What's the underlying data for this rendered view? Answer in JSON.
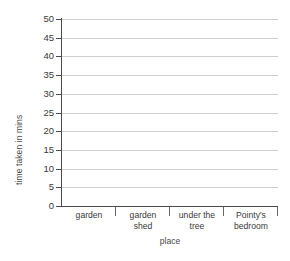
{
  "chart_data": {
    "type": "bar",
    "title": "",
    "subtitle": "",
    "xlabel": "place",
    "ylabel": "time taken in mins",
    "categories": [
      "garden",
      "garden shed",
      "under the tree",
      "Pointy's bedroom"
    ],
    "category_lines": [
      [
        "garden"
      ],
      [
        "garden",
        "shed"
      ],
      [
        "under the",
        "tree"
      ],
      [
        "Pointy's",
        "bedroom"
      ]
    ],
    "series": [
      {
        "name": "time taken",
        "values": [
          null,
          null,
          null,
          null
        ]
      }
    ],
    "values": [
      null,
      null,
      null,
      null
    ],
    "ylim": [
      0,
      50
    ],
    "ytick_step": 5,
    "yticks": [
      0,
      5,
      10,
      15,
      20,
      25,
      30,
      35,
      40,
      45,
      50
    ],
    "ytick_labels": [
      "0",
      "5",
      "10",
      "15",
      "20",
      "25",
      "30",
      "35",
      "40",
      "45",
      "50"
    ],
    "grid": true,
    "grid_axis": "y",
    "legend": false,
    "legend_position": "none",
    "annotations": [],
    "note": "blank grid template - no bars drawn"
  },
  "style": {
    "background": "#ffffff",
    "gridline_color": "#cfcfcf",
    "axis_color": "#4a4a4a",
    "text_color": "#3a3a3a",
    "separator_color": "#6a6a6a"
  }
}
